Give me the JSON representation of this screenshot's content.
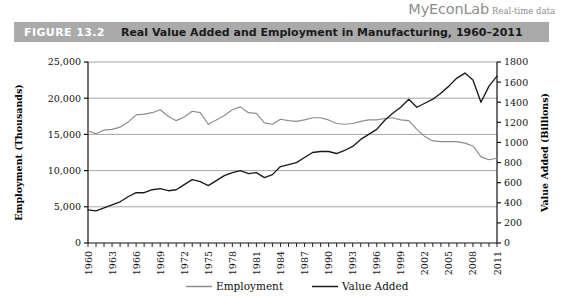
{
  "brand": {
    "logo": "MyEconLab",
    "subtitle": "Real-time data"
  },
  "figure": {
    "label": "FIGURE 13.2",
    "title": "Real Value Added and Employment in Manufacturing, 1960–2011",
    "banner_color": "#aaaaaa",
    "label_color": "#ffffff",
    "title_color": "#1a1a1a"
  },
  "chart_data": {
    "type": "line",
    "title": "Real Value Added and Employment in Manufacturing, 1960–2011",
    "xlabel": "",
    "ylabel": "Employment (Thousands)",
    "y2label": "Value Added (Billions)",
    "ylim": [
      0,
      25000
    ],
    "y2lim": [
      0,
      1800
    ],
    "xlim": [
      1960,
      2011
    ],
    "yticks": [
      "0",
      "5,000",
      "10,000",
      "15,000",
      "20,000",
      "25,000"
    ],
    "ytick_values": [
      0,
      5000,
      10000,
      15000,
      20000,
      25000
    ],
    "y2ticks": [
      "0",
      "200",
      "400",
      "600",
      "800",
      "1000",
      "1200",
      "1400",
      "1600",
      "1800"
    ],
    "y2tick_values": [
      0,
      200,
      400,
      600,
      800,
      1000,
      1200,
      1400,
      1600,
      1800
    ],
    "xticks": [
      "1960",
      "1963",
      "1966",
      "1969",
      "1972",
      "1975",
      "1978",
      "1981",
      "1984",
      "1987",
      "1990",
      "1993",
      "1996",
      "1999",
      "2002",
      "2005",
      "2008",
      "2011"
    ],
    "xtick_values": [
      1960,
      1963,
      1966,
      1969,
      1972,
      1975,
      1978,
      1981,
      1984,
      1987,
      1990,
      1993,
      1996,
      1999,
      2002,
      2005,
      2008,
      2011
    ],
    "grid": true,
    "legend_position": "bottom",
    "x": [
      1960,
      1961,
      1962,
      1963,
      1964,
      1965,
      1966,
      1967,
      1968,
      1969,
      1970,
      1971,
      1972,
      1973,
      1974,
      1975,
      1976,
      1977,
      1978,
      1979,
      1980,
      1981,
      1982,
      1983,
      1984,
      1985,
      1986,
      1987,
      1988,
      1989,
      1990,
      1991,
      1992,
      1993,
      1994,
      1995,
      1996,
      1997,
      1998,
      1999,
      2000,
      2001,
      2002,
      2003,
      2004,
      2005,
      2006,
      2007,
      2008,
      2009,
      2010,
      2011
    ],
    "series": [
      {
        "name": "Employment",
        "axis": "left",
        "unit": "thousands",
        "color": "#8c8c8c",
        "values": [
          15500,
          15100,
          15600,
          15700,
          16000,
          16700,
          17700,
          17800,
          18000,
          18400,
          17500,
          16900,
          17400,
          18200,
          18000,
          16400,
          17000,
          17600,
          18400,
          18800,
          18000,
          17900,
          16600,
          16400,
          17100,
          16900,
          16800,
          17000,
          17300,
          17300,
          17000,
          16500,
          16400,
          16500,
          16800,
          17000,
          17000,
          17200,
          17300,
          17000,
          16900,
          15700,
          14700,
          14100,
          14000,
          14000,
          14000,
          13800,
          13400,
          11900,
          11500,
          11700
        ]
      },
      {
        "name": "Value Added",
        "axis": "right",
        "unit": "billions",
        "color": "#1a1a1a",
        "values": [
          330,
          320,
          350,
          380,
          410,
          460,
          500,
          500,
          530,
          540,
          520,
          530,
          580,
          630,
          610,
          570,
          620,
          670,
          700,
          720,
          690,
          700,
          650,
          680,
          760,
          780,
          800,
          850,
          900,
          910,
          910,
          890,
          920,
          960,
          1030,
          1080,
          1130,
          1220,
          1290,
          1350,
          1430,
          1350,
          1390,
          1430,
          1490,
          1560,
          1640,
          1690,
          1620,
          1400,
          1560,
          1660
        ]
      }
    ]
  },
  "legend": {
    "items": [
      {
        "label": "Employment",
        "color": "#8c8c8c"
      },
      {
        "label": "Value Added",
        "color": "#1a1a1a"
      }
    ]
  }
}
